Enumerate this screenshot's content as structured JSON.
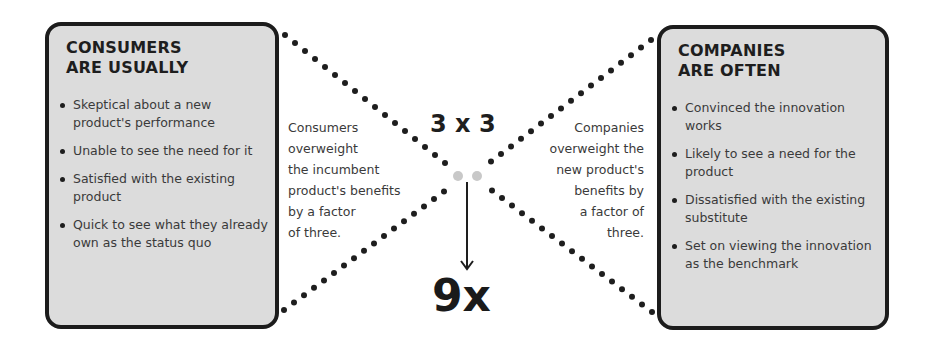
{
  "left_box": {
    "title_line1": "CONSUMERS",
    "title_line2": "ARE USUALLY",
    "items": [
      "Skeptical about a new product's performance",
      "Unable to see the need for it",
      "Satisfied with the existing product",
      "Quick to see what they already own as the status quo"
    ]
  },
  "right_box": {
    "title_line1": "COMPANIES",
    "title_line2": "ARE OFTEN",
    "items": [
      "Convinced the innovation works",
      "Likely to see a need for the product",
      "Dissatisfied with the existing substitute",
      "Set on viewing the innovation as the benchmark"
    ]
  },
  "center": {
    "left_caption": [
      "Consumers",
      "overweight",
      "the incumbent",
      "product's benefits",
      "by a factor",
      "of three."
    ],
    "right_caption": [
      "Companies",
      "overweight the",
      "new product's",
      "benefits by",
      "a factor of",
      "three."
    ],
    "multiplication": "3 x 3",
    "result": "9x"
  },
  "colors": {
    "box_fill": "#dcdcdc",
    "border": "#1c1c1c",
    "dot": "#1e1e1e",
    "faded_dot": "#c8c8c8"
  }
}
